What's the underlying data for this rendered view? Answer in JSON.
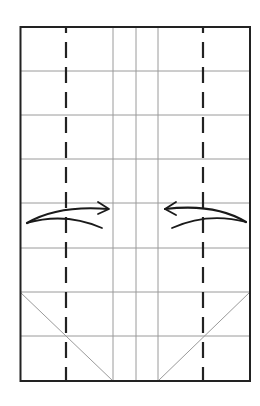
{
  "diagram": {
    "type": "origami-fold-diagram",
    "colors": {
      "background": "#ffffff",
      "border": "#222222",
      "crease": "#9a9a9a",
      "fold_line": "#222222",
      "arrow": "#1a1a1a"
    },
    "sheet": {
      "x": 20,
      "y": 27,
      "width": 230,
      "height": 354
    },
    "horizontal_creases_y": [
      71,
      115,
      159,
      203,
      248,
      292,
      336
    ],
    "vertical_creases_x": [
      113,
      136,
      158
    ],
    "dashed_fold_lines_x": [
      66,
      203
    ],
    "diagonal_creases": [
      {
        "from": [
          20,
          292
        ],
        "to": [
          113,
          381
        ]
      },
      {
        "from": [
          250,
          292
        ],
        "to": [
          158,
          381
        ]
      }
    ],
    "arrows": [
      {
        "name": "fold-left-flap-right",
        "direction": "right"
      },
      {
        "name": "fold-right-flap-left",
        "direction": "left"
      }
    ]
  }
}
